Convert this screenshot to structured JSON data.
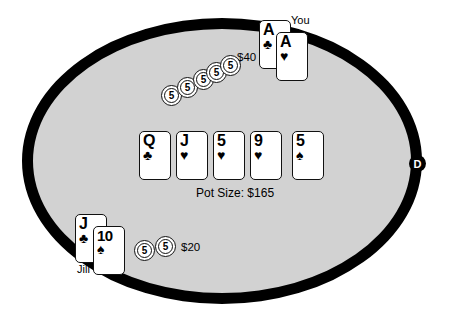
{
  "table": {
    "felt_color": "#d2d2d2",
    "border_color": "#000000",
    "background_color": "#ffffff"
  },
  "pot": {
    "label": "Pot Size: $165",
    "amount": "$165"
  },
  "dealer_button": {
    "label": "D"
  },
  "community_cards": [
    {
      "rank": "Q",
      "suit": "♣",
      "suit_name": "clubs"
    },
    {
      "rank": "J",
      "suit": "♥",
      "suit_name": "hearts"
    },
    {
      "rank": "5",
      "suit": "♥",
      "suit_name": "hearts"
    },
    {
      "rank": "9",
      "suit": "♥",
      "suit_name": "hearts"
    },
    {
      "rank": "5",
      "suit": "♠",
      "suit_name": "spades"
    }
  ],
  "players": [
    {
      "name": "You",
      "position": "top",
      "cards": [
        {
          "rank": "A",
          "suit": "♣",
          "suit_name": "clubs"
        },
        {
          "rank": "A",
          "suit": "♥",
          "suit_name": "hearts"
        }
      ],
      "bet_amount": "$40",
      "chip_count": 5,
      "chip_value": "5"
    },
    {
      "name": "Jill",
      "position": "bottom-left",
      "cards": [
        {
          "rank": "J",
          "suit": "♣",
          "suit_name": "clubs"
        },
        {
          "rank": "10",
          "suit": "♠",
          "suit_name": "spades"
        }
      ],
      "bet_amount": "$20",
      "chip_count": 2,
      "chip_value": "5"
    }
  ],
  "chips": {
    "top_stack": [
      {
        "value": "5",
        "x": 161,
        "y": 85
      },
      {
        "value": "5",
        "x": 177,
        "y": 77
      },
      {
        "value": "5",
        "x": 193,
        "y": 69
      },
      {
        "value": "5",
        "x": 206,
        "y": 62
      },
      {
        "value": "5",
        "x": 220,
        "y": 55
      }
    ],
    "bottom_stack": [
      {
        "value": "5",
        "x": 134,
        "y": 240
      },
      {
        "value": "5",
        "x": 155,
        "y": 236
      }
    ]
  }
}
